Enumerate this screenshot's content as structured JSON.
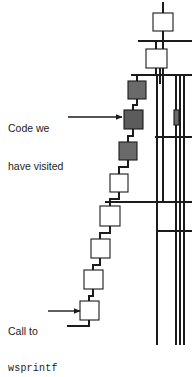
{
  "figure": {
    "kind": "call-graph-fragment",
    "background_color": "#ffffff",
    "stroke_color": "#1b1b1b",
    "node_fill_unvisited": "#ffffff",
    "node_fill_visited": "#6a6a6a",
    "node_fill_visited_dark": "#5c5c5c"
  },
  "annotations": {
    "visited": {
      "name": "visited-callout",
      "line1": "Code we",
      "line2": "have visited",
      "arrow": {
        "x1": 68,
        "y1": 117,
        "x2": 122,
        "y2": 117
      }
    },
    "call": {
      "name": "wsprintf-callout",
      "line1": "Call to",
      "line2": "wsprintf",
      "arrow": {
        "x1": 48,
        "y1": 311,
        "x2": 80,
        "y2": 311
      }
    }
  },
  "graph": {
    "nodes": [
      {
        "id": "n1",
        "name": "node-top",
        "x": 153,
        "y": 13,
        "w": 20,
        "h": 18,
        "state": "unvisited"
      },
      {
        "id": "n2",
        "name": "node-second",
        "x": 146,
        "y": 49,
        "w": 21,
        "h": 19,
        "state": "unvisited"
      },
      {
        "id": "n3",
        "name": "node-visited-upper",
        "x": 128,
        "y": 81,
        "w": 18,
        "h": 18,
        "state": "visited"
      },
      {
        "id": "n4",
        "name": "node-visited-mid",
        "x": 124,
        "y": 110,
        "w": 19,
        "h": 19,
        "state": "visited-dark"
      },
      {
        "id": "n5",
        "name": "node-visited-lower",
        "x": 119,
        "y": 142,
        "w": 18,
        "h": 18,
        "state": "visited"
      },
      {
        "id": "n6",
        "name": "node-white-1",
        "x": 110,
        "y": 174,
        "w": 18,
        "h": 18,
        "state": "unvisited"
      },
      {
        "id": "n7",
        "name": "node-white-2",
        "x": 100,
        "y": 206,
        "w": 20,
        "h": 20,
        "state": "unvisited"
      },
      {
        "id": "n8",
        "name": "node-white-3",
        "x": 91,
        "y": 239,
        "w": 19,
        "h": 19,
        "state": "unvisited"
      },
      {
        "id": "n9",
        "name": "node-white-4",
        "x": 84,
        "y": 270,
        "w": 19,
        "h": 19,
        "state": "unvisited"
      },
      {
        "id": "n10",
        "name": "node-wsprintf",
        "x": 80,
        "y": 301,
        "w": 19,
        "h": 19,
        "state": "unvisited"
      },
      {
        "id": "n11",
        "name": "node-edge-marker",
        "x": 174,
        "y": 110,
        "w": 5,
        "h": 15,
        "state": "visited"
      }
    ],
    "edges": [
      {
        "name": "edge-stub-top",
        "points": "163,2 163,13"
      },
      {
        "name": "edge-n1-n2",
        "points": "163,31 163,41 156,41 156,49"
      },
      {
        "name": "edge-n2-n3",
        "points": "156,68 156,75 137,75 137,81"
      },
      {
        "name": "edge-n3-n4",
        "points": "137,99 137,105 133,105 133,110"
      },
      {
        "name": "edge-n4-n5",
        "points": "133,129 133,136 128,136 128,142"
      },
      {
        "name": "edge-n5-n6",
        "points": "128,160 128,167 119,167 119,174"
      },
      {
        "name": "edge-n6-n7",
        "points": "119,192 119,199 110,199 110,206"
      },
      {
        "name": "edge-n7-n8",
        "points": "110,226 110,233 100,233 100,239"
      },
      {
        "name": "edge-n8-n9",
        "points": "100,258 100,265 93,265 93,270"
      },
      {
        "name": "edge-n9-n10",
        "points": "93,289 93,296 89,296 89,301"
      },
      {
        "name": "edge-n10-out",
        "points": "89,320 89,326 67,326"
      },
      {
        "name": "edge-n2-bus",
        "points": "160,68 160,84"
      },
      {
        "name": "edge-trunk-a",
        "points": "163,41 163,202"
      },
      {
        "name": "edge-trunk-b",
        "points": "157,75 157,345"
      }
    ],
    "rails": [
      {
        "name": "rail-horizontal-1",
        "x1": 138,
        "y1": 41,
        "x2": 192,
        "y2": 41
      },
      {
        "name": "rail-horizontal-2",
        "x1": 131,
        "y1": 75,
        "x2": 192,
        "y2": 75
      },
      {
        "name": "rail-horizontal-3",
        "x1": 155,
        "y1": 137,
        "x2": 192,
        "y2": 137
      },
      {
        "name": "rail-horizontal-4",
        "x1": 105,
        "y1": 202,
        "x2": 192,
        "y2": 202
      },
      {
        "name": "rail-horizontal-5",
        "x1": 157,
        "y1": 231,
        "x2": 192,
        "y2": 231
      },
      {
        "name": "rail-vertical-1",
        "x1": 176,
        "y1": 75,
        "x2": 176,
        "y2": 345
      },
      {
        "name": "rail-vertical-2",
        "x1": 180,
        "y1": 75,
        "x2": 180,
        "y2": 345
      },
      {
        "name": "rail-vertical-3",
        "x1": 184,
        "y1": 75,
        "x2": 184,
        "y2": 345
      }
    ]
  }
}
